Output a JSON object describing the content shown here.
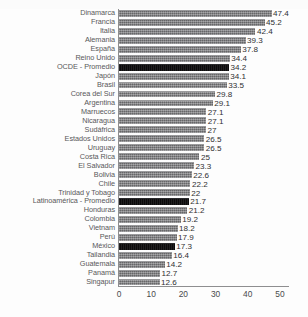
{
  "chart_data": {
    "type": "bar",
    "orientation": "horizontal",
    "title": "",
    "subtitle": "",
    "xlabel": "",
    "ylabel": "",
    "xlim": [
      0,
      52.5
    ],
    "xticks": [
      0,
      10,
      20,
      30,
      40,
      50
    ],
    "xtick_labels": [
      "0",
      "10",
      "20",
      "30",
      "40",
      "50"
    ],
    "grid": false,
    "legend": null,
    "bar_color": "#7c7c7e",
    "highlight_color": "#100f10",
    "axis_color": "#8e8e90",
    "background_color": "#fdfdfd",
    "categories": [
      "Dinamarca",
      "Francia",
      "Italia",
      "Alemania",
      "España",
      "Reino Unido",
      "OCDE - Promedio",
      "Japón",
      "Brasil",
      "Corea del Sur",
      "Argentina",
      "Marruecos",
      "Nicaragua",
      "Sudáfrica",
      "Estados Unidos",
      "Uruguay",
      "Costa Rica",
      "El Salvador",
      "Bolivia",
      "Chile",
      "Trinidad y Tobago",
      "Latinoamérica - Promedio",
      "Honduras",
      "Colombia",
      "Vietnam",
      "Perú",
      "México",
      "Tailandia",
      "Guatemala",
      "Panamá",
      "Singapur"
    ],
    "values": [
      47.4,
      45.2,
      42.4,
      39.3,
      37.8,
      34.4,
      34.2,
      34.1,
      33.5,
      29.8,
      29.1,
      27.1,
      27.1,
      27,
      26.5,
      26.5,
      25,
      23.3,
      22.6,
      22.2,
      22,
      21.7,
      21.2,
      19.2,
      18.2,
      17.9,
      17.3,
      16.4,
      14.2,
      12.7,
      12.6
    ],
    "value_labels": [
      "47.4",
      "45.2",
      "42.4",
      "39.3",
      "37.8",
      "34.4",
      "34.2",
      "34.1",
      "33.5",
      "29.8",
      "29.1",
      "27.1",
      "27.1",
      "27",
      "26.5",
      "26.5",
      "25",
      "23.3",
      "22.6",
      "22.2",
      "22",
      "21.7",
      "21.2",
      "19.2",
      "18.2",
      "17.9",
      "17.3",
      "16.4",
      "14.2",
      "12.7",
      "12.6"
    ],
    "highlighted": [
      false,
      false,
      false,
      false,
      false,
      false,
      true,
      false,
      false,
      false,
      false,
      false,
      false,
      false,
      false,
      false,
      false,
      false,
      false,
      false,
      false,
      true,
      false,
      false,
      false,
      false,
      true,
      false,
      false,
      false,
      false
    ]
  }
}
